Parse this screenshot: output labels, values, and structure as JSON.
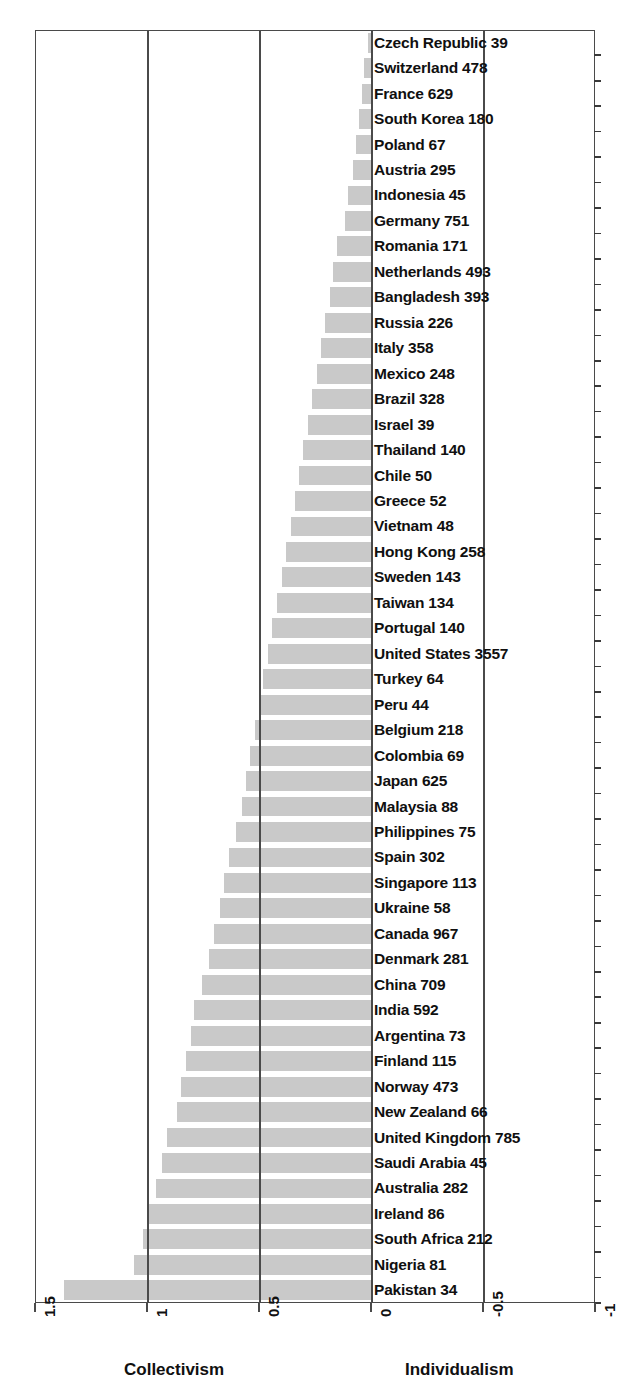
{
  "chart_data": {
    "type": "bar",
    "orientation": "horizontal",
    "title": "",
    "xlabel": "",
    "ylabel": "",
    "xlim": [
      1.5,
      -1
    ],
    "x_reversed": true,
    "grid": true,
    "legend": null,
    "xticks": [
      "1.5",
      "1",
      "0.5",
      "0",
      "-0.5",
      "-1"
    ],
    "xtick_values": [
      1.5,
      1,
      0.5,
      0,
      -0.5,
      -1
    ],
    "left_axis_title": "Collectivism",
    "right_axis_title": "Individualism",
    "bar_color": "#c9c9c9",
    "categories": [
      "Czech Republic",
      "Switzerland",
      "France",
      "South Korea",
      "Poland",
      "Austria",
      "Indonesia",
      "Germany",
      "Romania",
      "Netherlands",
      "Bangladesh",
      "Russia",
      "Italy",
      "Mexico",
      "Brazil",
      "Israel",
      "Thailand",
      "Chile",
      "Greece",
      "Vietnam",
      "Hong Kong",
      "Sweden",
      "Taiwan",
      "Portugal",
      "United States",
      "Turkey",
      "Peru",
      "Belgium",
      "Colombia",
      "Japan",
      "Malaysia",
      "Philippines",
      "Spain",
      "Singapore",
      "Ukraine",
      "Canada",
      "Denmark",
      "China",
      "India",
      "Argentina",
      "Finland",
      "Norway",
      "New Zealand",
      "United Kingdom",
      "Saudi Arabia",
      "Australia",
      "Ireland",
      "South Africa",
      "Nigeria",
      "Pakistan"
    ],
    "counts": [
      39,
      478,
      629,
      180,
      67,
      295,
      45,
      751,
      171,
      493,
      393,
      226,
      358,
      248,
      328,
      39,
      140,
      50,
      52,
      48,
      258,
      143,
      134,
      140,
      3557,
      64,
      44,
      218,
      69,
      625,
      88,
      75,
      302,
      113,
      58,
      967,
      281,
      709,
      592,
      73,
      115,
      473,
      66,
      785,
      45,
      282,
      86,
      212,
      81,
      34
    ],
    "values": [
      0.015,
      0.03,
      0.042,
      0.055,
      0.068,
      0.082,
      0.102,
      0.118,
      0.15,
      0.168,
      0.185,
      0.205,
      0.222,
      0.24,
      0.262,
      0.282,
      0.305,
      0.322,
      0.34,
      0.358,
      0.378,
      0.398,
      0.42,
      0.44,
      0.462,
      0.482,
      0.5,
      0.518,
      0.538,
      0.558,
      0.578,
      0.602,
      0.632,
      0.655,
      0.672,
      0.7,
      0.722,
      0.755,
      0.788,
      0.805,
      0.828,
      0.848,
      0.868,
      0.912,
      0.935,
      0.962,
      0.99,
      1.02,
      1.06,
      1.37
    ],
    "labels": [
      "Czech Republic 39",
      "Switzerland 478",
      "France 629",
      "South Korea 180",
      "Poland 67",
      "Austria 295",
      "Indonesia 45",
      "Germany 751",
      "Romania 171",
      "Netherlands 493",
      "Bangladesh 393",
      "Russia 226",
      "Italy 358",
      "Mexico 248",
      "Brazil 328",
      "Israel 39",
      "Thailand 140",
      "Chile 50",
      "Greece 52",
      "Vietnam 48",
      "Hong Kong 258",
      "Sweden 143",
      "Taiwan 134",
      "Portugal 140",
      "United States 3557",
      "Turkey 64",
      "Peru 44",
      "Belgium 218",
      "Colombia 69",
      "Japan 625",
      "Malaysia 88",
      "Philippines 75",
      "Spain 302",
      "Singapore 113",
      "Ukraine 58",
      "Canada 967",
      "Denmark 281",
      "China 709",
      "India 592",
      "Argentina 73",
      "Finland 115",
      "Norway 473",
      "New Zealand 66",
      "United Kingdom 785",
      "Saudi Arabia 45",
      "Australia 282",
      "Ireland 86",
      "South Africa 212",
      "Nigeria 81",
      "Pakistan 34"
    ]
  }
}
